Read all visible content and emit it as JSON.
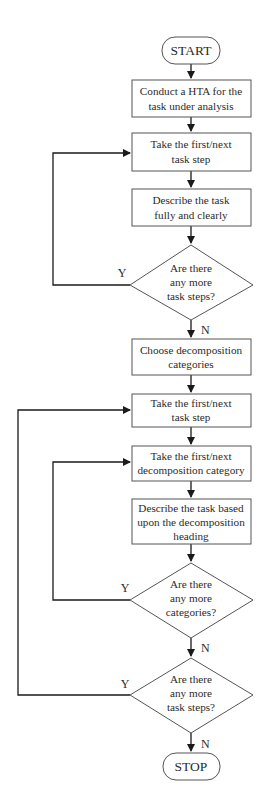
{
  "diagram": {
    "type": "flowchart",
    "colors": {
      "stroke": "#555555",
      "line": "#1a1a1a",
      "text": "#2b2b2b",
      "background": "#ffffff"
    },
    "nodes": [
      {
        "id": "start",
        "shape": "terminal",
        "lines": [
          "START"
        ]
      },
      {
        "id": "conduct_hta",
        "shape": "process",
        "lines": [
          "Conduct a HTA for the",
          "task under analysis"
        ]
      },
      {
        "id": "take_step_1",
        "shape": "process",
        "lines": [
          "Take the first/next",
          "task step"
        ]
      },
      {
        "id": "describe_task",
        "shape": "process",
        "lines": [
          "Describe the task",
          "fully and clearly"
        ]
      },
      {
        "id": "more_steps_1",
        "shape": "decision",
        "lines": [
          "Are there",
          "any more",
          "task steps?"
        ]
      },
      {
        "id": "choose_categories",
        "shape": "process",
        "lines": [
          "Choose decomposition",
          "categories"
        ]
      },
      {
        "id": "take_step_2",
        "shape": "process",
        "lines": [
          "Take the first/next",
          "task step"
        ]
      },
      {
        "id": "take_category",
        "shape": "process",
        "lines": [
          "Take the first/next",
          "decomposition category"
        ]
      },
      {
        "id": "describe_heading",
        "shape": "process",
        "lines": [
          "Describe the task based",
          "upon the decomposition",
          "heading"
        ]
      },
      {
        "id": "more_categories",
        "shape": "decision",
        "lines": [
          "Are there",
          "any more",
          "categories?"
        ]
      },
      {
        "id": "more_steps_2",
        "shape": "decision",
        "lines": [
          "Are there",
          "any more",
          "task steps?"
        ]
      },
      {
        "id": "stop",
        "shape": "terminal",
        "lines": [
          "STOP"
        ]
      }
    ],
    "edges": [
      {
        "from": "start",
        "to": "conduct_hta",
        "label": ""
      },
      {
        "from": "conduct_hta",
        "to": "take_step_1",
        "label": ""
      },
      {
        "from": "take_step_1",
        "to": "describe_task",
        "label": ""
      },
      {
        "from": "describe_task",
        "to": "more_steps_1",
        "label": ""
      },
      {
        "from": "more_steps_1",
        "to": "take_step_1",
        "label": "Y"
      },
      {
        "from": "more_steps_1",
        "to": "choose_categories",
        "label": "N"
      },
      {
        "from": "choose_categories",
        "to": "take_step_2",
        "label": ""
      },
      {
        "from": "take_step_2",
        "to": "take_category",
        "label": ""
      },
      {
        "from": "take_category",
        "to": "describe_heading",
        "label": ""
      },
      {
        "from": "describe_heading",
        "to": "more_categories",
        "label": ""
      },
      {
        "from": "more_categories",
        "to": "take_category",
        "label": "Y"
      },
      {
        "from": "more_categories",
        "to": "more_steps_2",
        "label": "N"
      },
      {
        "from": "more_steps_2",
        "to": "take_step_2",
        "label": "Y"
      },
      {
        "from": "more_steps_2",
        "to": "stop",
        "label": "N"
      }
    ],
    "edge_labels": {
      "yes": "Y",
      "no": "N"
    }
  }
}
